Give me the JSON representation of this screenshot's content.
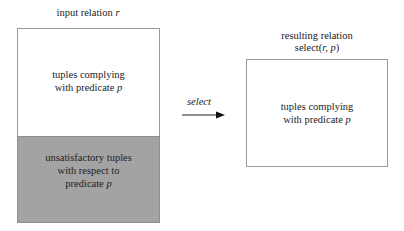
{
  "input_relation": {
    "title_prefix": "input relation ",
    "title_var": "r",
    "complying": {
      "line1": "tuples complying",
      "line2_prefix": "with predicate ",
      "line2_var": "p"
    },
    "unsatisfactory": {
      "line1": "unsatisfactory tuples",
      "line2": "with respect to",
      "line3_prefix": "predicate ",
      "line3_var": "p"
    },
    "colors": {
      "complying_fill": "#ffffff",
      "unsatisfactory_fill": "#a3a3a3"
    }
  },
  "operation": {
    "label": "select"
  },
  "result_relation": {
    "title_line1": "resulting relation",
    "title_line2_prefix": "select(",
    "title_line2_args": "r, p",
    "title_line2_suffix": ")",
    "complying": {
      "line1": "tuples complying",
      "line2_prefix": "with predicate ",
      "line2_var": "p"
    }
  }
}
